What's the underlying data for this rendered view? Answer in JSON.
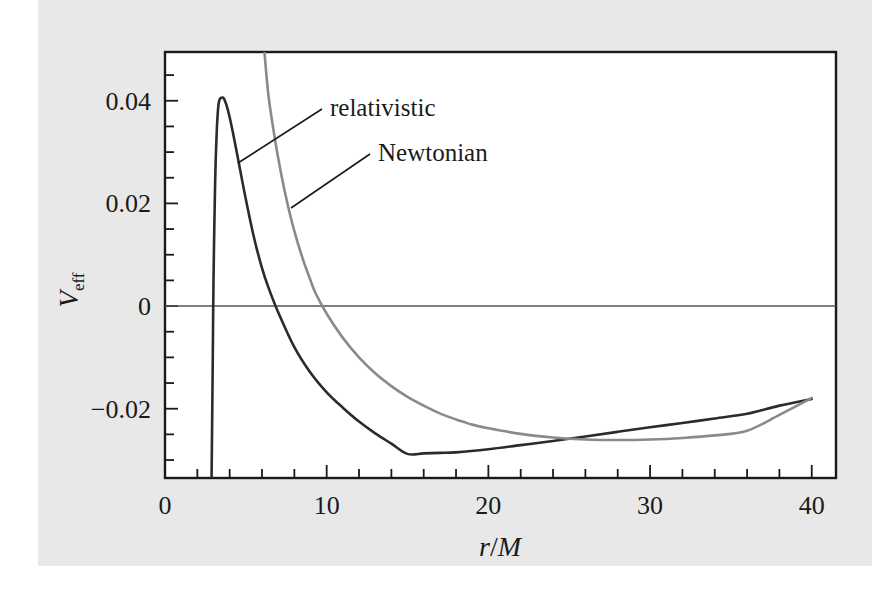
{
  "figure": {
    "background_color": "#ffffff",
    "paper_color": "#e8e8e8",
    "plot_area_color": "#ffffff",
    "frame_color": "#1a1a1a"
  },
  "chart_data": {
    "type": "line",
    "title": "",
    "subtitle": "",
    "xlabel": "r/M",
    "ylabel": "V_eff",
    "xlim": [
      0,
      41.5
    ],
    "ylim": [
      -0.0335,
      0.0495
    ],
    "grid": false,
    "zero_line": true,
    "legend_position": "inline-annotations",
    "x_ticks_major": [
      0,
      10,
      20,
      30,
      40
    ],
    "x_tick_labels": [
      "0",
      "10",
      "20",
      "30",
      "40"
    ],
    "x_tick_minor_step": 2,
    "y_ticks_major": [
      0.04,
      0.02,
      0,
      -0.02
    ],
    "y_tick_labels": [
      "0.04",
      "0.02",
      "0",
      "−0.02"
    ],
    "y_tick_minor_step": 0.005,
    "annotations": [
      {
        "text": "relativistic",
        "x_px": 330,
        "y_px": 116,
        "leader_to_x": 238,
        "leader_to_y": 163
      },
      {
        "text": "Newtonian",
        "x_px": 378,
        "y_px": 161,
        "leader_to_x": 291,
        "leader_to_y": 208
      }
    ],
    "series": [
      {
        "name": "relativistic",
        "color": "#2b2b2b",
        "width": 2.6,
        "formula": "-M/r + L^2/(2 r^2) - M L^2 / r^3",
        "L_over_M": 4.3,
        "peak": {
          "r": 3.63,
          "V": 0.0405
        },
        "minimum": {
          "r": 15.0,
          "V": -0.0288
        },
        "zero_crossing": {
          "r": 6.4
        },
        "x": [
          2.88,
          2.95,
          3.0,
          3.1,
          3.2,
          3.3,
          3.4,
          3.5,
          3.63,
          3.8,
          4.0,
          4.2,
          4.4,
          4.6,
          4.8,
          5.0,
          5.5,
          6.0,
          6.4,
          7.0,
          8.0,
          9.0,
          10.0,
          11.0,
          12.0,
          13.0,
          14.0,
          15.0,
          16.0,
          17.0,
          18.0,
          20.0,
          22.0,
          24.0,
          26.0,
          28.0,
          30.0,
          32.0,
          34.0,
          36.0,
          38.0,
          40.0
        ],
        "y": [
          -0.0335,
          -0.012,
          0.005,
          0.024,
          0.034,
          0.039,
          0.0404,
          0.0406,
          0.0405,
          0.0392,
          0.0368,
          0.0338,
          0.0306,
          0.0273,
          0.024,
          0.0208,
          0.0134,
          0.0074,
          0.0036,
          -0.0012,
          -0.008,
          -0.013,
          -0.0168,
          -0.0198,
          -0.0225,
          -0.0248,
          -0.0268,
          -0.0288,
          -0.0287,
          -0.0286,
          -0.0285,
          -0.0279,
          -0.0271,
          -0.0263,
          -0.0254,
          -0.0245,
          -0.0236,
          -0.0228,
          -0.0219,
          -0.021,
          -0.0194,
          -0.0181
        ]
      },
      {
        "name": "Newtonian",
        "color": "#8a8a8a",
        "width": 2.6,
        "formula": "-M/r + L^2/(2 r^2)",
        "L_over_M": 4.3,
        "minimum": {
          "r": 18.5,
          "V": -0.0265
        },
        "zero_crossing": {
          "r": 9.3
        },
        "x": [
          6.15,
          6.4,
          6.8,
          7.2,
          7.6,
          8.0,
          8.5,
          9.0,
          9.3,
          10.0,
          11.0,
          12.0,
          13.0,
          14.0,
          15.0,
          16.0,
          17.0,
          18.0,
          18.5,
          19.0,
          20.0,
          22.0,
          24.0,
          26.0,
          28.0,
          30.0,
          32.0,
          34.0,
          36.0,
          38.0,
          40.0
        ],
        "y": [
          0.0495,
          0.041,
          0.0325,
          0.0255,
          0.0196,
          0.0146,
          0.0094,
          0.005,
          0.0026,
          -0.0015,
          -0.0062,
          -0.01,
          -0.0131,
          -0.0156,
          -0.0177,
          -0.0194,
          -0.0209,
          -0.0221,
          -0.0226,
          -0.0231,
          -0.0238,
          -0.0249,
          -0.0256,
          -0.026,
          -0.0261,
          -0.026,
          -0.0257,
          -0.0252,
          -0.0243,
          -0.0212,
          -0.0179
        ]
      }
    ]
  },
  "ylabel_parts": {
    "main": "V",
    "sub": "eff"
  },
  "xlabel_parts": {
    "numerator": "r",
    "slash": "/",
    "denominator": "M"
  }
}
